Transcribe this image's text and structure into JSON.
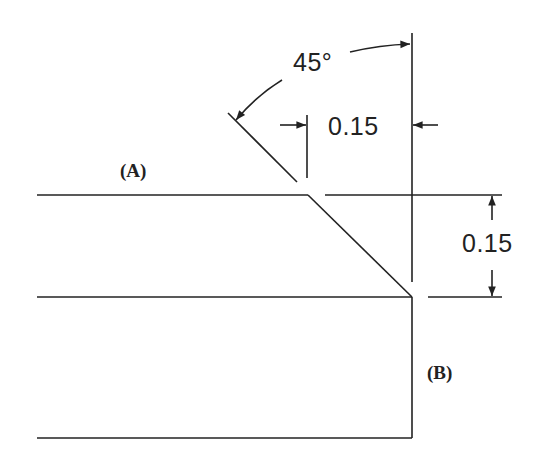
{
  "diagram": {
    "type": "chamfer-dimension-drawing",
    "labels": {
      "surface_a": "(A)",
      "surface_b": "(B)"
    },
    "dimensions": {
      "angle": "45°",
      "horizontal": "0.15",
      "vertical": "0.15"
    },
    "colors": {
      "line": "#222222",
      "background": "#ffffff"
    }
  }
}
